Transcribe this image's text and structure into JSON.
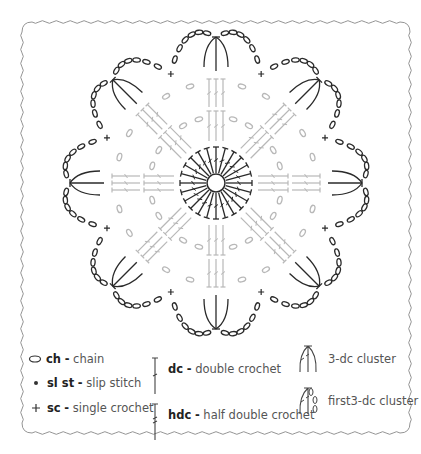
{
  "diagram": {
    "symmetry": 8,
    "colors": {
      "outer_round": "#2a2a2a",
      "inner_rounds": "#b8b8b8",
      "center_round": "#2a2a2a",
      "border": "#888888",
      "background": "#ffffff"
    },
    "rounds": [
      {
        "round": 1,
        "stitch": "dc",
        "count": 24,
        "color": "dark",
        "note": "dc worked into center ring"
      },
      {
        "round": 2,
        "stitch": "dc",
        "note": "groups of dc with ch spaces",
        "color": "light"
      },
      {
        "round": 3,
        "stitch": "dc",
        "note": "groups of dc with ch spaces",
        "color": "light"
      },
      {
        "round": 4,
        "stitch": "3-dc cluster + ch arcs + sc",
        "petals": 8,
        "color": "dark"
      }
    ]
  },
  "legend": {
    "items": [
      {
        "symbol": "chain-icon",
        "abbr": "ch",
        "sep": "-",
        "name": "chain"
      },
      {
        "symbol": "slip-stitch-icon",
        "abbr": "sl st",
        "sep": "-",
        "name": "slip stitch"
      },
      {
        "symbol": "single-crochet-icon",
        "abbr": "sc",
        "sep": "-",
        "name": "single crochet"
      },
      {
        "symbol": "double-crochet-icon",
        "abbr": "dc",
        "sep": "-",
        "name": "double crochet"
      },
      {
        "symbol": "half-double-crochet-icon",
        "abbr": "hdc",
        "sep": "-",
        "name": "half double crochet"
      },
      {
        "symbol": "3dc-cluster-icon",
        "abbr": "",
        "sep": "",
        "name": "3-dc cluster"
      },
      {
        "symbol": "first-3dc-cluster-icon",
        "abbr": "",
        "sep": "",
        "name": "first3-dc cluster"
      }
    ]
  }
}
